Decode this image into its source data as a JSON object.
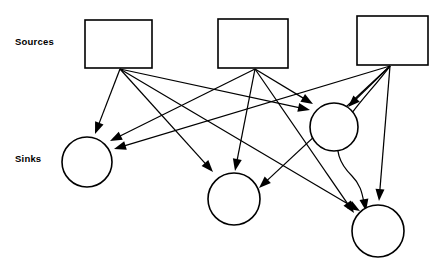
{
  "diagram": {
    "background_color": "#ffffff",
    "stroke_color": "#000000",
    "width": 437,
    "height": 265,
    "labels": {
      "sources": "Sources",
      "sinks": "Sinks"
    },
    "sources": [
      {
        "id": "source-1",
        "shape": "rectangle",
        "x": 85,
        "y": 20,
        "width": 67,
        "height": 48,
        "anchor_x": 120,
        "anchor_y": 69
      },
      {
        "id": "source-2",
        "shape": "rectangle",
        "x": 218,
        "y": 19,
        "width": 70,
        "height": 49,
        "anchor_x": 255,
        "anchor_y": 69
      },
      {
        "id": "source-3",
        "shape": "rectangle",
        "x": 357,
        "y": 16,
        "width": 71,
        "height": 49,
        "anchor_x": 390,
        "anchor_y": 66
      }
    ],
    "sinks": [
      {
        "id": "sink-1",
        "shape": "circle",
        "cx": 87,
        "cy": 162,
        "r": 25
      },
      {
        "id": "sink-2",
        "shape": "circle",
        "cx": 234,
        "cy": 199,
        "r": 26
      },
      {
        "id": "sink-3",
        "shape": "circle",
        "cx": 378,
        "cy": 231,
        "r": 26
      },
      {
        "id": "sink-4",
        "shape": "circle",
        "cx": 334,
        "cy": 127,
        "r": 24
      }
    ],
    "edges": [
      {
        "id": "edge-s1-k1",
        "from": "source-1",
        "to": "sink-1",
        "type": "line",
        "x1": 120,
        "y1": 69,
        "x2": 95,
        "y2": 134,
        "arrow": true
      },
      {
        "id": "edge-s1-k2",
        "from": "source-1",
        "to": "sink-2",
        "type": "line",
        "x1": 120,
        "y1": 69,
        "x2": 213,
        "y2": 172,
        "arrow": true
      },
      {
        "id": "edge-s1-k4",
        "from": "source-1",
        "to": "sink-4",
        "type": "line",
        "x1": 120,
        "y1": 69,
        "x2": 310,
        "y2": 110,
        "arrow": true
      },
      {
        "id": "edge-s1-k3",
        "from": "source-1",
        "to": "sink-3",
        "type": "line",
        "x1": 120,
        "y1": 69,
        "x2": 360,
        "y2": 211,
        "arrow": true
      },
      {
        "id": "edge-s2-k1",
        "from": "source-2",
        "to": "sink-1",
        "type": "line",
        "x1": 255,
        "y1": 69,
        "x2": 110,
        "y2": 141,
        "arrow": true
      },
      {
        "id": "edge-s2-k2",
        "from": "source-2",
        "to": "sink-2",
        "type": "line",
        "x1": 255,
        "y1": 69,
        "x2": 235,
        "y2": 171,
        "arrow": true
      },
      {
        "id": "edge-s2-k4",
        "from": "source-2",
        "to": "sink-4",
        "type": "line",
        "x1": 255,
        "y1": 69,
        "x2": 313,
        "y2": 104,
        "arrow": true
      },
      {
        "id": "edge-s2-k3",
        "from": "source-2",
        "to": "sink-3",
        "type": "line",
        "x1": 255,
        "y1": 69,
        "x2": 354,
        "y2": 213,
        "arrow": true
      },
      {
        "id": "edge-s3-k1",
        "from": "source-3",
        "to": "sink-1",
        "type": "line",
        "x1": 390,
        "y1": 66,
        "x2": 114,
        "y2": 149,
        "arrow": true
      },
      {
        "id": "edge-s3-k2",
        "from": "source-3",
        "to": "sink-2",
        "type": "line",
        "x1": 390,
        "y1": 66,
        "x2": 259,
        "y2": 188,
        "arrow": true
      },
      {
        "id": "edge-s3-k4",
        "from": "source-3",
        "to": "sink-4",
        "type": "line",
        "x1": 390,
        "y1": 66,
        "x2": 348,
        "y2": 107,
        "arrow": true
      },
      {
        "id": "edge-s3-k3",
        "from": "source-3",
        "to": "sink-3",
        "type": "line",
        "x1": 390,
        "y1": 66,
        "x2": 379,
        "y2": 201,
        "arrow": true
      },
      {
        "id": "edge-s3-k3-curve",
        "from": "source-3",
        "to": "sink-3",
        "type": "curve",
        "path": "M 390 66 C 357 110 315 140 352 176 C 360 184 362 192 364 203",
        "arrow": true,
        "tip_x": 366,
        "tip_y": 211,
        "tip_angle": 80
      }
    ]
  }
}
